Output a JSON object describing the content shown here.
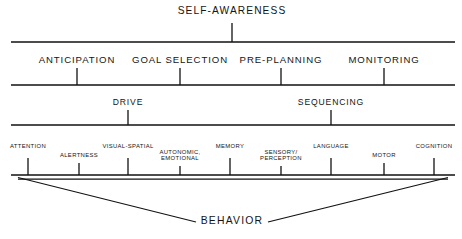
{
  "diagram": {
    "background_color": "#ffffff",
    "line_color": "#111111",
    "text_color": "#141414",
    "levels": [
      {
        "name": "self-awareness",
        "label": "SELF-AWARENESS",
        "label_x": 232,
        "label_y": 6,
        "line_y": 42,
        "line_x1": 11,
        "line_x2": 455,
        "nodes": [
          {
            "label": "SELF-AWARENESS",
            "x": 232
          }
        ]
      },
      {
        "name": "executive-functions",
        "line_y": 85,
        "line_x1": 11,
        "line_x2": 455,
        "nodes": [
          {
            "label": "ANTICIPATION",
            "x": 77
          },
          {
            "label": "GOAL SELECTION",
            "x": 180
          },
          {
            "label": "PRE-PLANNING",
            "x": 281
          },
          {
            "label": "MONITORING",
            "x": 384
          }
        ]
      },
      {
        "name": "drive-sequencing",
        "line_y": 125,
        "line_x1": 11,
        "line_x2": 455,
        "nodes": [
          {
            "label": "DRIVE",
            "x": 128
          },
          {
            "label": "SEQUENCING",
            "x": 331
          }
        ]
      },
      {
        "name": "cognitive-domains",
        "line_y": 175,
        "line_x1": 11,
        "line_x2": 455,
        "nodes": [
          {
            "label": "ATTENTION",
            "x": 28,
            "row": "upper"
          },
          {
            "label": "ALERTNESS",
            "x": 79,
            "row": "lower"
          },
          {
            "label": "VISUAL-SPATIAL",
            "x": 128,
            "row": "upper"
          },
          {
            "label": "AUTONOMIC,",
            "label2": "EMOTIONAL",
            "x": 180,
            "row": "lower"
          },
          {
            "label": "MEMORY",
            "x": 230,
            "row": "upper"
          },
          {
            "label": "SENSORY/",
            "label2": "PERCEPTION",
            "x": 281,
            "row": "lower"
          },
          {
            "label": "LANGUAGE",
            "x": 331,
            "row": "upper"
          },
          {
            "label": "MOTOR",
            "x": 384,
            "row": "lower"
          },
          {
            "label": "COGNITION",
            "x": 434,
            "row": "upper"
          }
        ]
      }
    ],
    "funnel": {
      "left_x": 18,
      "right_x": 448,
      "top_y": 179,
      "apex_left_x": 196,
      "apex_right_x": 268,
      "apex_y": 222
    },
    "outcome": {
      "label": "BEHAVIOR",
      "x": 232,
      "y": 215
    }
  }
}
